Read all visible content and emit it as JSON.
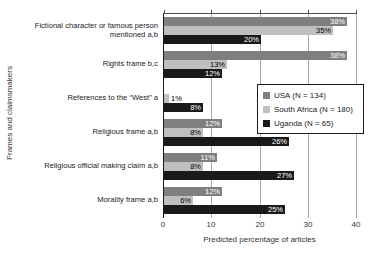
{
  "chart_data": {
    "type": "bar",
    "orientation": "horizontal",
    "title": "",
    "xlabel": "Predicted percentage of articles",
    "ylabel": "Frames and claimsmakers",
    "xlim": [
      0,
      40
    ],
    "xticks": [
      0,
      10,
      20,
      30,
      40
    ],
    "grid": true,
    "legend_position": "middle-right",
    "categories": [
      "Fictional character or famous person\nmentioned a,b",
      "Rights frame b,c",
      "References to the “West” a",
      "Religious frame a,b",
      "Religious official making claim a,b",
      "Morality frame a,b"
    ],
    "series": [
      {
        "name": "USA (N = 134)",
        "color": "#7f7f7f",
        "label_text_color": "#ffffff",
        "values": [
          38,
          38,
          0,
          12,
          11,
          12
        ],
        "value_labels": [
          "38%",
          "38%",
          "",
          "12%",
          "11%",
          "12%"
        ]
      },
      {
        "name": "South Africa (N = 180)",
        "color": "#bfbfbf",
        "label_text_color": "#000000",
        "values": [
          35,
          13,
          1,
          8,
          8,
          6
        ],
        "value_labels": [
          "35%",
          "13%",
          "1%",
          "8%",
          "8%",
          "6%"
        ]
      },
      {
        "name": "Uganda (N = 65)",
        "color": "#1a1a1a",
        "label_text_color": "#ffffff",
        "values": [
          20,
          12,
          8,
          26,
          27,
          25
        ],
        "value_labels": [
          "20%",
          "12%",
          "8%",
          "26%",
          "27%",
          "25%"
        ]
      }
    ]
  }
}
